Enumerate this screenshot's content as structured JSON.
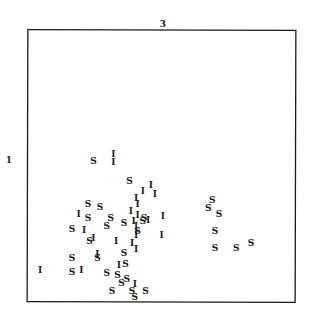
{
  "chart_data": {
    "type": "scatter",
    "title": "",
    "top_label": "3",
    "left_label": "1",
    "xlabel": "3",
    "ylabel": "1",
    "xlim": [
      0,
      1
    ],
    "ylim": [
      0,
      1
    ],
    "grid": false,
    "legend": "none",
    "marker_type": "letter",
    "series": [
      {
        "name": "S",
        "marker": "S",
        "points": [
          [
            0.245,
            0.52
          ],
          [
            0.38,
            0.448
          ],
          [
            0.225,
            0.363
          ],
          [
            0.27,
            0.35
          ],
          [
            0.225,
            0.31
          ],
          [
            0.31,
            0.31
          ],
          [
            0.435,
            0.308
          ],
          [
            0.36,
            0.292
          ],
          [
            0.295,
            0.28
          ],
          [
            0.41,
            0.26
          ],
          [
            0.36,
            0.18
          ],
          [
            0.335,
            0.1
          ],
          [
            0.43,
            0.3
          ],
          [
            0.165,
            0.27
          ],
          [
            0.23,
            0.225
          ],
          [
            0.165,
            0.16
          ],
          [
            0.165,
            0.11
          ],
          [
            0.365,
            0.138
          ],
          [
            0.26,
            0.16
          ],
          [
            0.35,
            0.07
          ],
          [
            0.295,
            0.105
          ],
          [
            0.37,
            0.085
          ],
          [
            0.39,
            0.04
          ],
          [
            0.315,
            0.04
          ],
          [
            0.44,
            0.04
          ],
          [
            0.4,
            0.015
          ],
          [
            0.69,
            0.375
          ],
          [
            0.675,
            0.345
          ],
          [
            0.715,
            0.325
          ],
          [
            0.7,
            0.262
          ],
          [
            0.7,
            0.2
          ],
          [
            0.78,
            0.2
          ],
          [
            0.835,
            0.215
          ]
        ]
      },
      {
        "name": "I",
        "marker": "I",
        "points": [
          [
            0.32,
            0.545
          ],
          [
            0.32,
            0.515
          ],
          [
            0.46,
            0.432
          ],
          [
            0.43,
            0.41
          ],
          [
            0.475,
            0.4
          ],
          [
            0.405,
            0.385
          ],
          [
            0.41,
            0.36
          ],
          [
            0.385,
            0.335
          ],
          [
            0.19,
            0.325
          ],
          [
            0.395,
            0.3
          ],
          [
            0.405,
            0.28
          ],
          [
            0.41,
            0.32
          ],
          [
            0.45,
            0.302
          ],
          [
            0.505,
            0.315
          ],
          [
            0.21,
            0.265
          ],
          [
            0.245,
            0.235
          ],
          [
            0.405,
            0.245
          ],
          [
            0.5,
            0.245
          ],
          [
            0.39,
            0.215
          ],
          [
            0.26,
            0.175
          ],
          [
            0.405,
            0.195
          ],
          [
            0.34,
            0.135
          ],
          [
            0.2,
            0.115
          ],
          [
            0.045,
            0.115
          ],
          [
            0.4,
            0.065
          ],
          [
            0.33,
            0.225
          ]
        ]
      }
    ]
  }
}
